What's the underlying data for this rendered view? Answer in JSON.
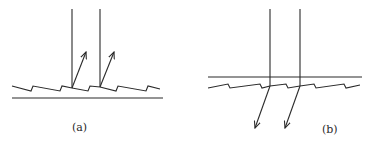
{
  "figure": {
    "panels": [
      {
        "id": "a",
        "label": "(a)",
        "description": "Incident vertical rays reflected from a blazed (sawtooth) grating surface; reflected rays travel up and to the right",
        "interaction": "reflection"
      },
      {
        "id": "b",
        "label": "(b)",
        "description": "Incident vertical rays transmitted through a flat top surface and a sawtooth back surface; transmitted rays are refracted down and to the left",
        "interaction": "transmission"
      }
    ]
  },
  "colors": {
    "line": "#2a2a2a",
    "background": "#ffffff"
  }
}
